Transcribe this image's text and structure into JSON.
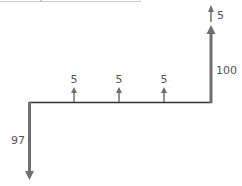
{
  "diagram": {
    "type": "cash-flow-diagram",
    "colors": {
      "arrow": "#6f6f6f",
      "timeline": "#333333",
      "label": "#555555",
      "frame": "#cccccc"
    },
    "initial_outflow": {
      "label": "97",
      "direction": "down"
    },
    "coupons": [
      {
        "label": "5",
        "direction": "up"
      },
      {
        "label": "5",
        "direction": "up"
      },
      {
        "label": "5",
        "direction": "up"
      }
    ],
    "final": {
      "principal": {
        "label": "100",
        "direction": "up"
      },
      "coupon": {
        "label": "5",
        "direction": "up"
      }
    }
  }
}
